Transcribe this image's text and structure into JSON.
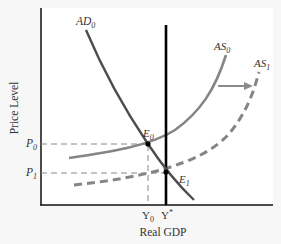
{
  "diagram": {
    "title": "",
    "axes": {
      "x_label": "Real GDP",
      "y_label": "Price Level"
    },
    "curves": {
      "ad0": {
        "label": "AD",
        "sub": "0",
        "style": "solid",
        "color": "#4a4a4a"
      },
      "as0": {
        "label": "AS",
        "sub": "0",
        "style": "solid",
        "color": "#808080"
      },
      "as1": {
        "label": "AS",
        "sub": "1",
        "style": "dashed",
        "color": "#808080"
      },
      "lras": {
        "label": "Y*",
        "style": "solid",
        "color": "#000000"
      }
    },
    "points": {
      "e0": {
        "label": "E",
        "sub": "0"
      },
      "e1": {
        "label": "E",
        "sub": "1"
      }
    },
    "price_ticks": [
      {
        "label": "P",
        "sub": "0"
      },
      {
        "label": "P",
        "sub": "1"
      }
    ],
    "output_ticks": [
      {
        "label": "Y",
        "sub": "0"
      },
      {
        "label": "Y",
        "sup": "*"
      }
    ],
    "shift_arrow": {
      "direction": "right",
      "from": "AS0",
      "to": "AS1"
    }
  }
}
